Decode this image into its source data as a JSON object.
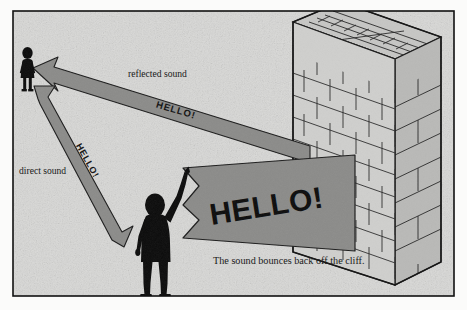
{
  "figure": {
    "caption": "The sound bounces back off the cliff.",
    "labels": {
      "reflected_sound": "reflected sound",
      "direct_sound": "direct sound",
      "shout_large": "HELLO!",
      "shout_reflected": "HELLO!",
      "shout_direct": "HELLO!"
    },
    "figures": {
      "listener": "listener-silhouette",
      "shouter": "shouting-person-silhouette"
    },
    "objects": {
      "wall": "brick-cliff-wall"
    },
    "colors": {
      "background": "#d9d9d7",
      "paper": "#fbfbfa",
      "frame": "#111111",
      "arrow_fill": "#8b8b89",
      "arrow_stroke": "#1a1a1a",
      "brick_face": "#cfcfcd",
      "brick_top": "#c2c2c0",
      "brick_side": "#b5b5b3",
      "brick_line": "#1a1a1a",
      "silhouette": "#0b0b0b",
      "text": "#121212"
    },
    "geometry": {
      "width": 467,
      "height": 310,
      "frame_inset": {
        "x": 12,
        "y": 10,
        "w": 443,
        "h": 287
      }
    }
  }
}
